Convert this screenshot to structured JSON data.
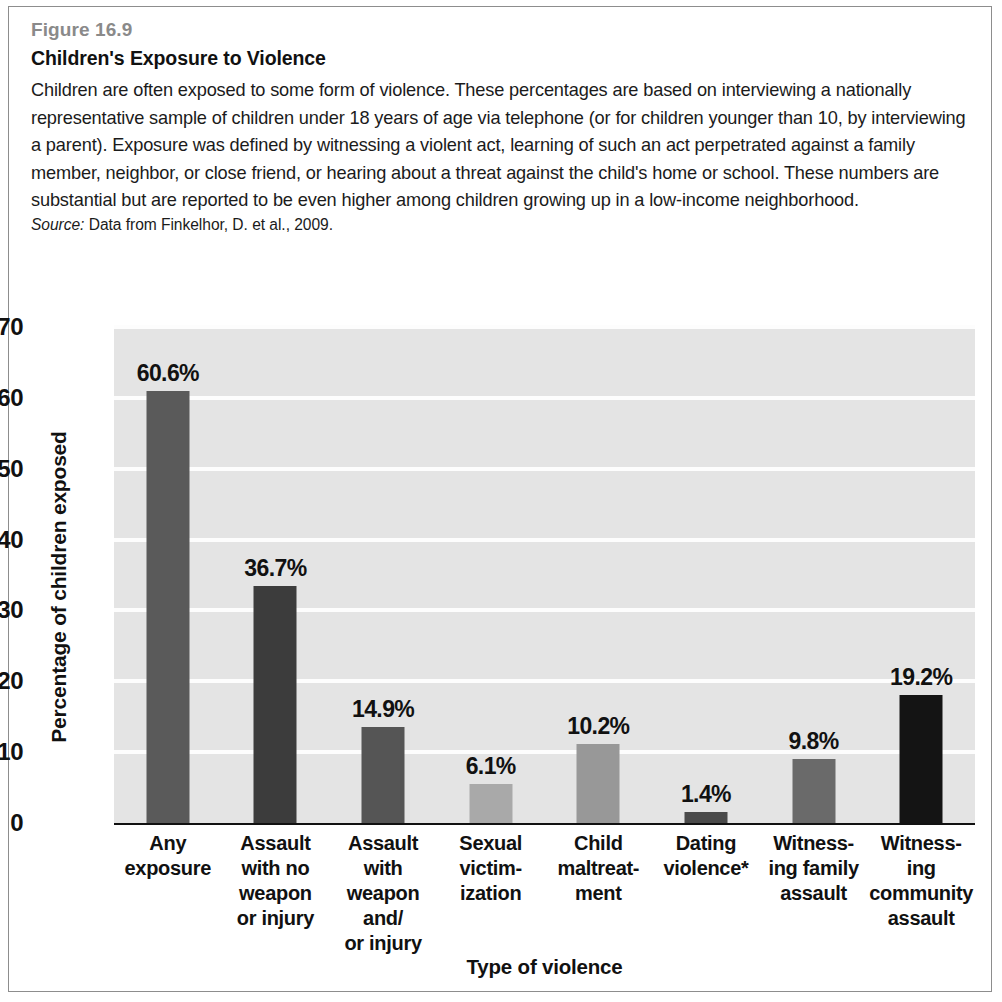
{
  "figure": {
    "number": "Figure 16.9",
    "title": "Children's Exposure to Violence",
    "body": "Children are often exposed to some form of violence. These percentages are based on interviewing a nationally representative sample of children under 18 years of age via telephone (or for children younger than 10, by interviewing a parent). Exposure was defined by witnessing a violent act, learning of such an act perpetrated against a family member, neighbor, or close friend, or hearing about a threat against the child's home or school. These numbers are substantial but are reported to be even higher among children growing up in a low-income neighborhood.",
    "source_label": "Source:",
    "source_text": " Data from Finkelhor, D. et al., 2009."
  },
  "chart_data": {
    "type": "bar",
    "title": "Children's Exposure to Violence",
    "xlabel": "Type of violence",
    "ylabel": "Percentage of children exposed",
    "ylim": [
      0,
      70
    ],
    "yticks": [
      0,
      10,
      20,
      30,
      40,
      50,
      60,
      70
    ],
    "grid": true,
    "legend": false,
    "categories": [
      "Any exposure",
      "Assault with no weapon or injury",
      "Assault with weapon and/or injury",
      "Sexual victimization",
      "Child maltreatment",
      "Dating violence*",
      "Witnessing family assault",
      "Witnessing community assault"
    ],
    "category_lines": [
      [
        "Any",
        "exposure"
      ],
      [
        "Assault",
        "with no",
        "weapon",
        "or injury"
      ],
      [
        "Assault",
        "with",
        "weapon",
        "and/",
        "or injury"
      ],
      [
        "Sexual",
        "victim-",
        "ization"
      ],
      [
        "Child",
        "maltreat-",
        "ment"
      ],
      [
        "Dating",
        "violence*"
      ],
      [
        "Witness-",
        "ing family",
        "assault"
      ],
      [
        "Witness-",
        "ing",
        "community",
        "assault"
      ]
    ],
    "values": [
      60.6,
      36.7,
      14.9,
      6.1,
      10.2,
      1.4,
      9.8,
      19.2
    ],
    "data_labels": [
      "60.6%",
      "36.7%",
      "14.9%",
      "6.1%",
      "10.2%",
      "1.4%",
      "9.8%",
      "19.2%"
    ],
    "drawn_heights": [
      61.0,
      33.4,
      13.6,
      5.5,
      11.1,
      1.5,
      9.0,
      18.0
    ],
    "bar_colors": [
      "#5a5a5a",
      "#3c3c3c",
      "#555555",
      "#a9a9a9",
      "#989898",
      "#4a4a4a",
      "#6a6a6a",
      "#141414"
    ],
    "plot_background": "#e4e4e4",
    "gridline_color": "#fdfdfd"
  }
}
